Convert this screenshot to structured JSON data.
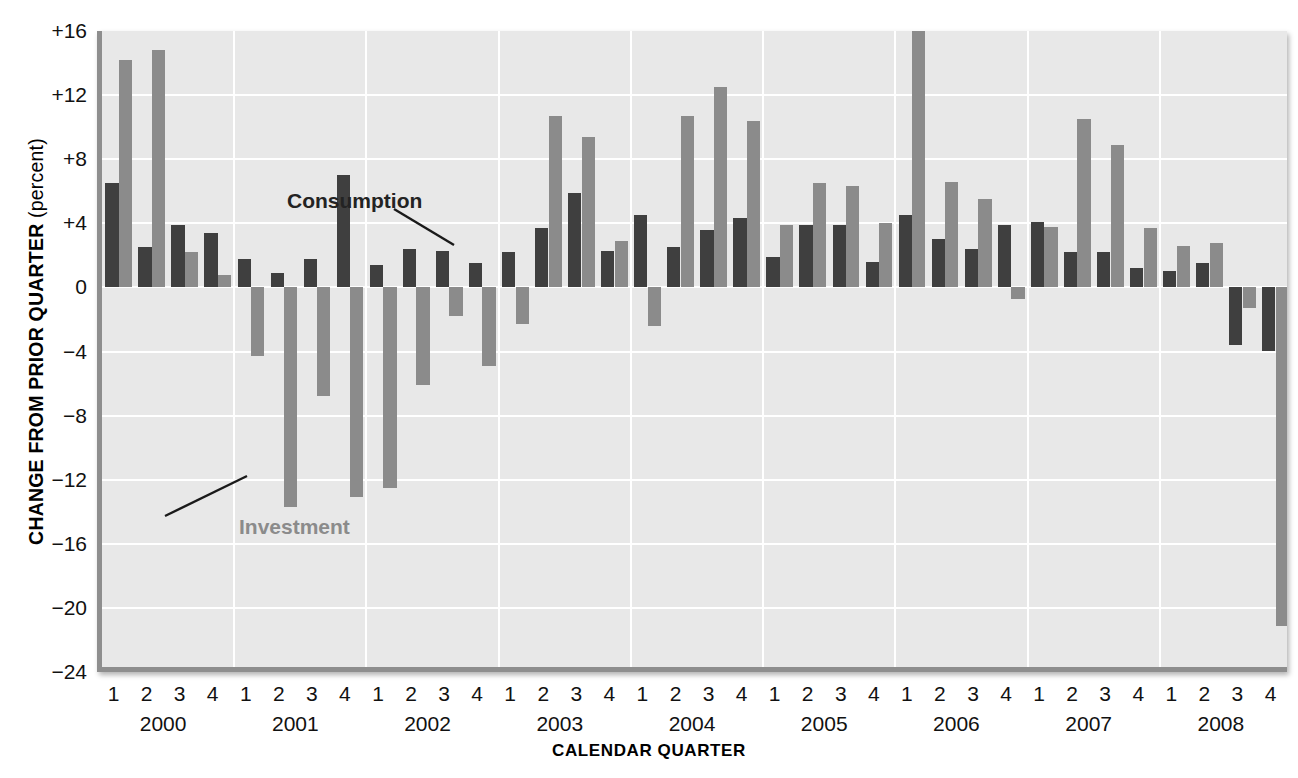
{
  "chart_data": {
    "type": "bar",
    "title": "",
    "xlabel": "CALENDAR QUARTER",
    "ylabel": "CHANGE FROM PRIOR QUARTER",
    "ylabel_unit": "(percent)",
    "ylim": [
      -24,
      16
    ],
    "ytick_step": 4,
    "ytick_labels": [
      "+16",
      "+12",
      "+8",
      "+4",
      "0",
      "−4",
      "−8",
      "−12",
      "−16",
      "−20",
      "−24"
    ],
    "ytick_values": [
      16,
      12,
      8,
      4,
      0,
      -4,
      -8,
      -12,
      -16,
      -20,
      -24
    ],
    "grid": true,
    "legend": "inline-annotations",
    "quarter_labels": [
      "1",
      "2",
      "3",
      "4"
    ],
    "years": [
      "2000",
      "2001",
      "2002",
      "2003",
      "2004",
      "2005",
      "2006",
      "2007",
      "2008"
    ],
    "categories": [
      "2000 Q1",
      "2000 Q2",
      "2000 Q3",
      "2000 Q4",
      "2001 Q1",
      "2001 Q2",
      "2001 Q3",
      "2001 Q4",
      "2002 Q1",
      "2002 Q2",
      "2002 Q3",
      "2002 Q4",
      "2003 Q1",
      "2003 Q2",
      "2003 Q3",
      "2003 Q4",
      "2004 Q1",
      "2004 Q2",
      "2004 Q3",
      "2004 Q4",
      "2005 Q1",
      "2005 Q2",
      "2005 Q3",
      "2005 Q4",
      "2006 Q1",
      "2006 Q2",
      "2006 Q3",
      "2006 Q4",
      "2007 Q1",
      "2007 Q2",
      "2007 Q3",
      "2007 Q4",
      "2008 Q1",
      "2008 Q2",
      "2008 Q3",
      "2008 Q4"
    ],
    "series": [
      {
        "name": "Consumption",
        "color": "#3f3f3f",
        "values": [
          6.5,
          2.5,
          3.9,
          3.4,
          1.8,
          0.9,
          1.8,
          7.0,
          1.4,
          2.4,
          2.3,
          1.5,
          2.2,
          3.7,
          5.9,
          2.3,
          4.5,
          2.5,
          3.6,
          4.3,
          1.9,
          3.9,
          3.9,
          1.6,
          4.5,
          3.0,
          2.4,
          3.9,
          4.1,
          2.2,
          2.2,
          1.2,
          1.0,
          1.5,
          -3.6,
          -4.0
        ]
      },
      {
        "name": "Investment",
        "color": "#8b8b8b",
        "values": [
          14.2,
          14.8,
          2.2,
          0.8,
          -4.3,
          -13.7,
          -6.8,
          -13.1,
          -12.5,
          -6.1,
          -1.8,
          -4.9,
          -2.3,
          10.7,
          9.4,
          2.9,
          -2.4,
          10.7,
          12.5,
          10.4,
          3.9,
          6.5,
          6.3,
          4.0,
          16.1,
          6.6,
          5.5,
          -0.7,
          3.8,
          10.5,
          8.9,
          3.7,
          2.6,
          2.8,
          -1.3,
          -21.1
        ]
      }
    ],
    "annotations": [
      {
        "label": "Consumption",
        "series": "Consumption",
        "points_to": "2001 Q4"
      },
      {
        "label": "Investment",
        "series": "Investment",
        "points_to": "2001 Q2"
      }
    ]
  }
}
